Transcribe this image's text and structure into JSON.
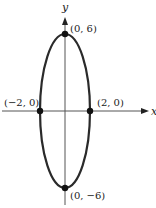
{
  "diagram": {
    "type": "ellipse-graph",
    "axes": {
      "x_label": "x",
      "y_label": "y"
    },
    "ellipse": {
      "center": [
        0,
        0
      ],
      "semi_x": 2,
      "semi_y": 6
    },
    "points": [
      {
        "label": "(0, 6)",
        "x": 0,
        "y": 6
      },
      {
        "label": "(0, −6)",
        "x": 0,
        "y": -6
      },
      {
        "label": "(−2, 0)",
        "x": -2,
        "y": 0
      },
      {
        "label": "(2, 0)",
        "x": 2,
        "y": 0
      }
    ],
    "colors": {
      "curve": "#2a2a2a",
      "axis": "#555555"
    }
  }
}
